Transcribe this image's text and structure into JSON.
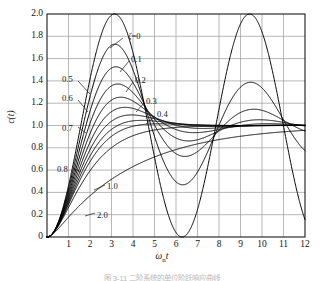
{
  "figure": {
    "caption": "图 3-11  二阶系统的单位阶跃响应曲线"
  },
  "axes": {
    "y_title": "c(t)",
    "x_title_main": "ω",
    "x_title_sub": "n",
    "x_title_tail": "t",
    "y_ticks": [
      "0",
      "0.2",
      "0.4",
      "0.6",
      "0.8",
      "1.0",
      "1.2",
      "1.4",
      "1.6",
      "1.8",
      "2.0"
    ],
    "x_ticks": [
      "0",
      "1",
      "2",
      "3",
      "4",
      "5",
      "6",
      "7",
      "8",
      "9",
      "10",
      "11",
      "12"
    ],
    "grid": true,
    "grid_color": "#9a9a9a",
    "frame_color": "#1a1a1a",
    "curve_color": "#000000"
  },
  "curve_labels": [
    {
      "id": "zeta-0",
      "prefix": "ζ=",
      "text": "0",
      "x": 128,
      "y": 32,
      "leader": [
        123,
        38,
        110,
        48
      ]
    },
    {
      "id": "zeta-01",
      "prefix": "",
      "text": "0.1",
      "x": 131,
      "y": 55,
      "leader": [
        129,
        61,
        120,
        72
      ]
    },
    {
      "id": "zeta-02",
      "prefix": "",
      "text": "0.2",
      "x": 135,
      "y": 76,
      "leader": [
        133,
        82,
        126,
        92
      ]
    },
    {
      "id": "zeta-03",
      "prefix": "",
      "text": "0.3",
      "x": 146,
      "y": 97,
      "leader": [
        144,
        103,
        136,
        112
      ]
    },
    {
      "id": "zeta-04",
      "prefix": "",
      "text": "0.4",
      "x": 157,
      "y": 110,
      "leader": [
        155,
        116,
        146,
        124
      ]
    },
    {
      "id": "zeta-05",
      "prefix": "",
      "text": "0.5",
      "x": 62,
      "y": 75,
      "leader": [
        78,
        81,
        90,
        94
      ]
    },
    {
      "id": "zeta-06",
      "prefix": "",
      "text": "0.6",
      "x": 62,
      "y": 94,
      "leader": [
        78,
        100,
        88,
        112
      ]
    },
    {
      "id": "zeta-07",
      "prefix": "",
      "text": "0.7",
      "x": 62,
      "y": 124,
      "leader": [
        78,
        127,
        86,
        133
      ]
    },
    {
      "id": "zeta-08",
      "prefix": "",
      "text": "0.8",
      "x": 57,
      "y": 165,
      "leader": [
        73,
        168,
        81,
        172
      ]
    },
    {
      "id": "zeta-10",
      "prefix": "",
      "text": "1.0",
      "x": 107,
      "y": 182,
      "leader": [
        105,
        185,
        94,
        190
      ]
    },
    {
      "id": "zeta-20",
      "prefix": "",
      "text": "2.0",
      "x": 97,
      "y": 211,
      "leader": [
        95,
        213,
        85,
        216
      ]
    }
  ],
  "chart_data": {
    "type": "line",
    "title": "",
    "subtitle": "",
    "xlabel": "ωn t",
    "ylabel": "c(t)",
    "xlim": [
      0,
      12
    ],
    "ylim": [
      0,
      2.0
    ],
    "xticks": [
      0,
      1,
      2,
      3,
      4,
      5,
      6,
      7,
      8,
      9,
      10,
      11,
      12
    ],
    "yticks": [
      0,
      0.2,
      0.4,
      0.6,
      0.8,
      1.0,
      1.2,
      1.4,
      1.6,
      1.8,
      2.0
    ],
    "grid": true,
    "legend": "inline-curve-labels",
    "series": [
      {
        "name": "ζ=0",
        "zeta": 0.0,
        "peak_value": 2.0,
        "peak_x": 3.14
      },
      {
        "name": "0.1",
        "zeta": 0.1,
        "peak_value": 1.73,
        "peak_x": 3.16
      },
      {
        "name": "0.2",
        "zeta": 0.2,
        "peak_value": 1.53,
        "peak_x": 3.21
      },
      {
        "name": "0.3",
        "zeta": 0.3,
        "peak_value": 1.37,
        "peak_x": 3.29
      },
      {
        "name": "0.4",
        "zeta": 0.4,
        "peak_value": 1.25,
        "peak_x": 3.43
      },
      {
        "name": "0.5",
        "zeta": 0.5,
        "peak_value": 1.16,
        "peak_x": 3.63
      },
      {
        "name": "0.6",
        "zeta": 0.6,
        "peak_value": 1.09,
        "peak_x": 3.93
      },
      {
        "name": "0.7",
        "zeta": 0.7,
        "peak_value": 1.05,
        "peak_x": 4.4
      },
      {
        "name": "0.8",
        "zeta": 0.8,
        "peak_value": 1.02,
        "peak_x": 5.24
      },
      {
        "name": "1.0",
        "zeta": 1.0,
        "peak_value": 1.0,
        "peak_x": 12.0
      },
      {
        "name": "2.0",
        "zeta": 2.0,
        "peak_value": 1.0,
        "peak_x": 12.0
      }
    ]
  }
}
